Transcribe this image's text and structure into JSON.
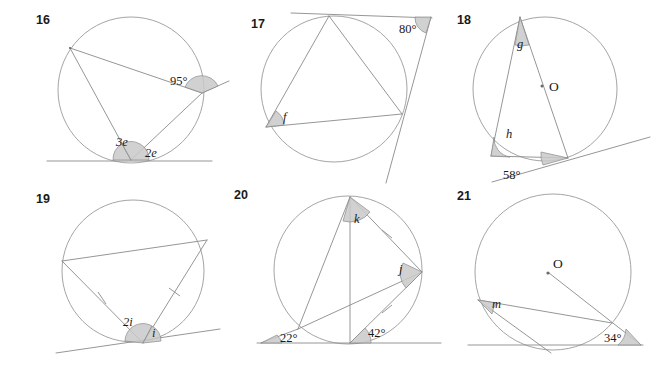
{
  "worksheet": {
    "title": "Circle theorems exercises 16-21",
    "background_color": "#ffffff",
    "line_color": "#8a8a8a",
    "wedge_fill": "#c9c9c9",
    "text_color": "#1a1a1a"
  },
  "figures": [
    {
      "number": "16",
      "number_pos": [
        36,
        24
      ],
      "circle": {
        "cx": 131,
        "cy": 90,
        "r": 73
      },
      "center_label": null,
      "tangent": {
        "x1": 47,
        "y1": 161,
        "x2": 212,
        "y2": 161,
        "label": "bottom-tangent"
      },
      "points": {
        "left": [
          70,
          48
        ],
        "right": [
          202,
          93
        ],
        "bottom": [
          131,
          160
        ]
      },
      "chords": [
        {
          "from": [
            70,
            48
          ],
          "to": [
            202,
            93
          ]
        },
        {
          "from": [
            70,
            48
          ],
          "to": [
            131,
            160
          ]
        },
        {
          "from": [
            131,
            160
          ],
          "to": [
            202,
            93
          ]
        }
      ],
      "extra_rays": [
        {
          "from": [
            202,
            93
          ],
          "to": [
            228,
            82
          ]
        }
      ],
      "angle_labels": [
        {
          "text": "95°",
          "x": 170,
          "y": 85,
          "style": "plain"
        },
        {
          "text": "3e",
          "x": 116,
          "y": 146,
          "style": "italic"
        },
        {
          "text": "2e",
          "x": 145,
          "y": 156,
          "style": "italic"
        }
      ]
    },
    {
      "number": "17",
      "number_pos": [
        251,
        28
      ],
      "circle": {
        "cx": 334,
        "cy": 89,
        "r": 73
      },
      "center_label": null,
      "tangent": {
        "x1": 291,
        "y1": 13,
        "x2": 432,
        "y2": 18,
        "label": "top-tangent"
      },
      "points": {
        "top": [
          329,
          16
        ],
        "left": [
          266,
          127
        ],
        "right": [
          402,
          114
        ],
        "apex": [
          431,
          17
        ]
      },
      "chords": [
        {
          "from": [
            329,
            16
          ],
          "to": [
            266,
            127
          ]
        },
        {
          "from": [
            329,
            16
          ],
          "to": [
            402,
            114
          ]
        },
        {
          "from": [
            266,
            127
          ],
          "to": [
            402,
            114
          ]
        }
      ],
      "extra_rays": [
        {
          "from": [
            431,
            17
          ],
          "to": [
            386,
            182
          ]
        }
      ],
      "angle_labels": [
        {
          "text": "80°",
          "x": 404,
          "y": 32,
          "style": "plain"
        },
        {
          "text": "f",
          "x": 281,
          "y": 119,
          "style": "italic"
        }
      ]
    },
    {
      "number": "18",
      "number_pos": [
        457,
        24
      ],
      "circle": {
        "cx": 545,
        "cy": 89,
        "r": 72
      },
      "center_label": "O",
      "center_label_pos": [
        552,
        84
      ],
      "center_dot": [
        543,
        86
      ],
      "tangent": {
        "x1": 495,
        "y1": 181,
        "x2": 648,
        "y2": 138,
        "label": "lower-tangent"
      },
      "points": {
        "top": [
          520,
          17
        ],
        "left": [
          491,
          156
        ],
        "bottom_right": [
          568,
          158
        ]
      },
      "chords": [
        {
          "from": [
            520,
            17
          ],
          "to": [
            491,
            156
          ]
        },
        {
          "from": [
            520,
            17
          ],
          "to": [
            568,
            158
          ]
        },
        {
          "from": [
            491,
            156
          ],
          "to": [
            568,
            158
          ]
        }
      ],
      "extra_rays": [],
      "angle_labels": [
        {
          "text": "g",
          "x": 519,
          "y": 43,
          "style": "italic"
        },
        {
          "text": "h",
          "x": 503,
          "y": 137,
          "style": "italic"
        },
        {
          "text": "58°",
          "x": 504,
          "y": 177,
          "style": "plain"
        }
      ]
    },
    {
      "number": "19",
      "number_pos": [
        36,
        203
      ],
      "circle": {
        "cx": 133,
        "cy": 271,
        "r": 71
      },
      "center_label": null,
      "tangent": {
        "x1": 58,
        "y1": 352,
        "x2": 218,
        "y2": 330,
        "label": "bottom-tangent"
      },
      "points": {
        "left": [
          62,
          261
        ],
        "right": [
          207,
          240
        ],
        "bottom": [
          143,
          343
        ]
      },
      "chords": [
        {
          "from": [
            62,
            261
          ],
          "to": [
            207,
            240
          ]
        },
        {
          "from": [
            62,
            261
          ],
          "to": [
            143,
            343
          ]
        },
        {
          "from": [
            143,
            343
          ],
          "to": [
            207,
            240
          ]
        }
      ],
      "tick_marks": [
        {
          "on": [
            [
              62,
              261
            ],
            [
              143,
              343
            ]
          ]
        },
        {
          "on": [
            [
              143,
              343
            ],
            [
              207,
              240
            ]
          ]
        }
      ],
      "angle_labels": [
        {
          "text": "2i",
          "x": 124,
          "y": 325,
          "style": "italic"
        },
        {
          "text": "i",
          "x": 152,
          "y": 336,
          "style": "italic"
        }
      ]
    },
    {
      "number": "20",
      "number_pos": [
        234,
        199
      ],
      "circle": {
        "cx": 348,
        "cy": 270,
        "r": 74
      },
      "center_label": null,
      "tangent": {
        "x1": 257,
        "y1": 343,
        "x2": 440,
        "y2": 343,
        "label": "bottom-tangent"
      },
      "points": {
        "top": [
          350,
          197
        ],
        "left": [
          298,
          329
        ],
        "right": [
          422,
          272
        ],
        "bottom": [
          350,
          343
        ]
      },
      "chords": [
        {
          "from": [
            350,
            197
          ],
          "to": [
            298,
            329
          ]
        },
        {
          "from": [
            350,
            197
          ],
          "to": [
            422,
            272
          ]
        },
        {
          "from": [
            350,
            197
          ],
          "to": [
            350,
            343
          ]
        },
        {
          "from": [
            298,
            329
          ],
          "to": [
            422,
            272
          ]
        },
        {
          "from": [
            350,
            343
          ],
          "to": [
            422,
            272
          ]
        }
      ],
      "extra_rays": [
        {
          "from": [
            298,
            329
          ],
          "to": [
            262,
            343
          ]
        }
      ],
      "tick_marks": [
        {
          "on": [
            [
              350,
              197
            ],
            [
              422,
              272
            ]
          ]
        },
        {
          "on": [
            [
              350,
              343
            ],
            [
              422,
              272
            ]
          ]
        }
      ],
      "angle_labels": [
        {
          "text": "k",
          "x": 355,
          "y": 217,
          "style": "italic"
        },
        {
          "text": "j",
          "x": 402,
          "y": 271,
          "style": "italic"
        },
        {
          "text": "22°",
          "x": 280,
          "y": 341,
          "style": "plain"
        },
        {
          "text": "42°",
          "x": 370,
          "y": 337,
          "style": "plain"
        }
      ]
    },
    {
      "number": "21",
      "number_pos": [
        457,
        200
      ],
      "circle": {
        "cx": 553,
        "cy": 272,
        "r": 78
      },
      "center_label": "O",
      "center_label_pos": [
        553,
        266
      ],
      "center_dot": [
        549,
        273
      ],
      "tangent": {
        "x1": 470,
        "y1": 345,
        "x2": 640,
        "y2": 345,
        "label": "bottom-tangent"
      },
      "points": {
        "left": [
          478,
          300
        ],
        "edge": [
          612,
          323
        ],
        "bottom": [
          551,
          353
        ],
        "apex": [
          640,
          345
        ]
      },
      "chords": [
        {
          "from": [
            478,
            300
          ],
          "to": [
            612,
            323
          ]
        },
        {
          "from": [
            478,
            300
          ],
          "to": [
            551,
            353
          ]
        },
        {
          "from": [
            549,
            273
          ],
          "to": [
            640,
            345
          ]
        }
      ],
      "angle_labels": [
        {
          "text": "m",
          "x": 492,
          "y": 306,
          "style": "italic"
        },
        {
          "text": "34°",
          "x": 607,
          "y": 342,
          "style": "plain"
        }
      ]
    }
  ]
}
